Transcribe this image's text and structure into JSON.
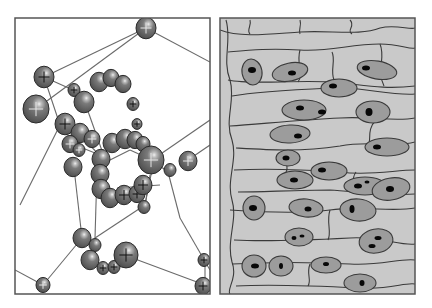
{
  "figure": {
    "width": 432,
    "height": 308,
    "background": "#ffffff",
    "colors": {
      "frame": "#555555",
      "network_line": "#6a6a6a",
      "sphere_fill": "#6e6e6e",
      "sphere_stroke": "#2a2a2a",
      "sphere_highlight": "#e8e8e8",
      "cell_fill": "#c9c9c9",
      "cell_stroke": "#3a3a3a",
      "nucleus_fill": "#9c9c9c",
      "nucleolus_fill": "#080808"
    }
  },
  "left_panel": {
    "name": "sphere-network-panel",
    "frame": {
      "x": 15,
      "y": 18,
      "w": 195,
      "h": 276
    },
    "lines": [
      [
        146,
        28,
        210,
        62
      ],
      [
        146,
        28,
        44,
        77
      ],
      [
        44,
        77,
        60,
        125
      ],
      [
        44,
        77,
        73,
        90
      ],
      [
        36,
        109,
        146,
        28
      ],
      [
        60,
        125,
        20,
        205
      ],
      [
        60,
        125,
        80,
        135
      ],
      [
        80,
        135,
        106,
        162
      ],
      [
        84,
        100,
        106,
        162
      ],
      [
        106,
        162,
        130,
        150
      ],
      [
        130,
        150,
        152,
        160
      ],
      [
        152,
        160,
        210,
        120
      ],
      [
        152,
        160,
        168,
        172
      ],
      [
        168,
        172,
        180,
        218
      ],
      [
        180,
        218,
        210,
        270
      ],
      [
        74,
        168,
        82,
        238
      ],
      [
        97,
        170,
        95,
        238
      ],
      [
        95,
        238,
        145,
        205
      ],
      [
        145,
        205,
        152,
        170
      ],
      [
        82,
        238,
        43,
        285
      ],
      [
        43,
        285,
        15,
        270
      ],
      [
        127,
        256,
        205,
        285
      ],
      [
        205,
        285,
        205,
        258
      ],
      [
        150,
        175,
        145,
        205
      ],
      [
        117,
        188,
        160,
        185
      ],
      [
        75,
        145,
        100,
        155
      ],
      [
        188,
        160,
        210,
        145
      ]
    ],
    "spheres": [
      {
        "cx": 146,
        "cy": 28,
        "r": 10,
        "cross": "white"
      },
      {
        "cx": 44,
        "cy": 77,
        "r": 10,
        "cross": "black"
      },
      {
        "cx": 36,
        "cy": 109,
        "r": 13,
        "cross": "white"
      },
      {
        "cx": 74,
        "cy": 90,
        "r": 6,
        "cross": "black"
      },
      {
        "cx": 99,
        "cy": 82,
        "r": 9,
        "cross": null
      },
      {
        "cx": 111,
        "cy": 78,
        "r": 8,
        "cross": null
      },
      {
        "cx": 123,
        "cy": 84,
        "r": 8,
        "cross": null
      },
      {
        "cx": 84,
        "cy": 102,
        "r": 10,
        "cross": null
      },
      {
        "cx": 133,
        "cy": 104,
        "r": 6,
        "cross": "black"
      },
      {
        "cx": 137,
        "cy": 124,
        "r": 5,
        "cross": "black"
      },
      {
        "cx": 65,
        "cy": 124,
        "r": 10,
        "cross": "black"
      },
      {
        "cx": 80,
        "cy": 133,
        "r": 9,
        "cross": null
      },
      {
        "cx": 70,
        "cy": 144,
        "r": 8,
        "cross": "white"
      },
      {
        "cx": 92,
        "cy": 139,
        "r": 8,
        "cross": "white"
      },
      {
        "cx": 79,
        "cy": 150,
        "r": 6,
        "cross": "white"
      },
      {
        "cx": 112,
        "cy": 143,
        "r": 9,
        "cross": null
      },
      {
        "cx": 125,
        "cy": 139,
        "r": 9,
        "cross": null
      },
      {
        "cx": 135,
        "cy": 140,
        "r": 8,
        "cross": null
      },
      {
        "cx": 143,
        "cy": 144,
        "r": 7,
        "cross": null
      },
      {
        "cx": 101,
        "cy": 159,
        "r": 9,
        "cross": null
      },
      {
        "cx": 151,
        "cy": 160,
        "r": 13,
        "cross": "white"
      },
      {
        "cx": 73,
        "cy": 167,
        "r": 9,
        "cross": null
      },
      {
        "cx": 100,
        "cy": 174,
        "r": 9,
        "cross": null
      },
      {
        "cx": 170,
        "cy": 170,
        "r": 6,
        "cross": null
      },
      {
        "cx": 188,
        "cy": 161,
        "r": 9,
        "cross": "white"
      },
      {
        "cx": 101,
        "cy": 189,
        "r": 9,
        "cross": null
      },
      {
        "cx": 110,
        "cy": 198,
        "r": 9,
        "cross": null
      },
      {
        "cx": 124,
        "cy": 195,
        "r": 9,
        "cross": "black"
      },
      {
        "cx": 137,
        "cy": 194,
        "r": 8,
        "cross": "black"
      },
      {
        "cx": 143,
        "cy": 185,
        "r": 9,
        "cross": "black"
      },
      {
        "cx": 144,
        "cy": 207,
        "r": 6,
        "cross": null
      },
      {
        "cx": 82,
        "cy": 238,
        "r": 9,
        "cross": null
      },
      {
        "cx": 95,
        "cy": 245,
        "r": 6,
        "cross": null
      },
      {
        "cx": 90,
        "cy": 260,
        "r": 9,
        "cross": null
      },
      {
        "cx": 103,
        "cy": 268,
        "r": 6,
        "cross": "black"
      },
      {
        "cx": 114,
        "cy": 267,
        "r": 6,
        "cross": "black"
      },
      {
        "cx": 126,
        "cy": 255,
        "r": 12,
        "cross": "black"
      },
      {
        "cx": 204,
        "cy": 260,
        "r": 6,
        "cross": "black"
      },
      {
        "cx": 203,
        "cy": 286,
        "r": 8,
        "cross": "black"
      },
      {
        "cx": 43,
        "cy": 285,
        "r": 7,
        "cross": "white"
      }
    ]
  },
  "right_panel": {
    "name": "cell-tissue-panel",
    "frame": {
      "x": 220,
      "y": 18,
      "w": 195,
      "h": 276
    },
    "boundaries": [
      "M220,30 C240,38 270,34 300,32 C330,30 360,36 380,28 C395,24 410,30 415,28",
      "M228,52 C250,50 270,48 300,50 C330,52 350,44 380,44 C400,44 410,50 415,48",
      "M228,80 C250,85 290,80 330,82 C360,84 380,90 415,86",
      "M232,96 C255,92 290,90 330,88 C360,86 390,96 415,94",
      "M230,126 C260,124 300,120 340,118 C370,116 395,122 415,118",
      "M236,148 C270,150 300,152 340,146 C370,140 395,148 415,142",
      "M234,170 C270,168 310,170 340,172 C370,176 395,170 415,170",
      "M238,192 C260,192 300,190 330,190 C360,192 390,196 415,194",
      "M230,210 C260,212 300,214 330,210 C360,206 395,212 415,208",
      "M234,240 C270,242 310,240 350,238 C380,236 400,246 415,244",
      "M232,264 C270,262 310,262 350,264 C380,266 400,258 415,260",
      "M236,286 C270,284 320,286 360,288 C390,290 405,282 415,284",
      "M226,20 C232,40 222,60 230,80 C236,100 224,120 232,140 C238,160 226,180 232,200 C238,220 226,240 232,262 C238,278 226,290 230,294",
      "M250,20 C252,26 246,30 250,34",
      "M300,20 C302,26 298,30 300,34",
      "M350,20 C356,26 346,30 352,34",
      "M332,52 C336,60 330,70 334,80",
      "M380,44 C386,58 376,70 384,86",
      "M376,120 C366,130 372,140 368,146",
      "M356,172 C350,180 356,186 352,192",
      "M330,210 C326,222 332,232 328,240",
      "M310,264 C306,274 312,280 308,286",
      "M300,50 C296,64 304,74 298,82",
      "M288,150 C282,160 290,166 286,172"
    ],
    "nuclei": [
      {
        "cx": 252,
        "cy": 72,
        "rx": 10,
        "ry": 13,
        "rot": -10,
        "spots": [
          {
            "cx": 252,
            "cy": 70,
            "rx": 4,
            "ry": 3
          }
        ]
      },
      {
        "cx": 290,
        "cy": 72,
        "rx": 18,
        "ry": 9,
        "rot": -12,
        "spots": [
          {
            "cx": 292,
            "cy": 73,
            "rx": 4,
            "ry": 2.5
          }
        ]
      },
      {
        "cx": 377,
        "cy": 70,
        "rx": 20,
        "ry": 9,
        "rot": 10,
        "spots": [
          {
            "cx": 366,
            "cy": 68,
            "rx": 4,
            "ry": 2.5
          }
        ]
      },
      {
        "cx": 339,
        "cy": 88,
        "rx": 18,
        "ry": 9,
        "rot": 0,
        "spots": [
          {
            "cx": 333,
            "cy": 86,
            "rx": 4,
            "ry": 2.5
          }
        ]
      },
      {
        "cx": 304,
        "cy": 110,
        "rx": 22,
        "ry": 10,
        "rot": 0,
        "spots": [
          {
            "cx": 300,
            "cy": 108,
            "rx": 4,
            "ry": 2.5
          },
          {
            "cx": 322,
            "cy": 112,
            "rx": 4,
            "ry": 2.5
          }
        ]
      },
      {
        "cx": 373,
        "cy": 112,
        "rx": 17,
        "ry": 11,
        "rot": 0,
        "spots": [
          {
            "cx": 369,
            "cy": 112,
            "rx": 3.5,
            "ry": 4
          }
        ]
      },
      {
        "cx": 290,
        "cy": 134,
        "rx": 20,
        "ry": 9,
        "rot": -3,
        "spots": [
          {
            "cx": 298,
            "cy": 136,
            "rx": 4,
            "ry": 2.5
          }
        ]
      },
      {
        "cx": 387,
        "cy": 147,
        "rx": 22,
        "ry": 9,
        "rot": 0,
        "spots": [
          {
            "cx": 377,
            "cy": 147,
            "rx": 4,
            "ry": 2.5
          }
        ]
      },
      {
        "cx": 329,
        "cy": 171,
        "rx": 18,
        "ry": 9,
        "rot": 0,
        "spots": [
          {
            "cx": 322,
            "cy": 170,
            "rx": 4,
            "ry": 2.5
          }
        ]
      },
      {
        "cx": 288,
        "cy": 158,
        "rx": 12,
        "ry": 8,
        "rot": 0,
        "spots": [
          {
            "cx": 286,
            "cy": 158,
            "rx": 3.5,
            "ry": 2.5
          }
        ]
      },
      {
        "cx": 365,
        "cy": 186,
        "rx": 21,
        "ry": 9,
        "rot": 0,
        "spots": [
          {
            "cx": 358,
            "cy": 186,
            "rx": 4,
            "ry": 2.5
          },
          {
            "cx": 367,
            "cy": 182,
            "rx": 2.5,
            "ry": 1.5
          }
        ]
      },
      {
        "cx": 295,
        "cy": 180,
        "rx": 18,
        "ry": 9,
        "rot": 0,
        "spots": [
          {
            "cx": 294,
            "cy": 180,
            "rx": 4,
            "ry": 2.5
          }
        ]
      },
      {
        "cx": 391,
        "cy": 189,
        "rx": 19,
        "ry": 11,
        "rot": -10,
        "spots": [
          {
            "cx": 390,
            "cy": 189,
            "rx": 4,
            "ry": 3
          }
        ]
      },
      {
        "cx": 254,
        "cy": 208,
        "rx": 11,
        "ry": 12,
        "rot": 0,
        "spots": [
          {
            "cx": 253,
            "cy": 208,
            "rx": 4,
            "ry": 3
          }
        ]
      },
      {
        "cx": 306,
        "cy": 208,
        "rx": 17,
        "ry": 9,
        "rot": 5,
        "spots": [
          {
            "cx": 308,
            "cy": 209,
            "rx": 3.5,
            "ry": 2.5
          }
        ]
      },
      {
        "cx": 358,
        "cy": 210,
        "rx": 18,
        "ry": 11,
        "rot": 5,
        "spots": [
          {
            "cx": 352,
            "cy": 209,
            "rx": 2.5,
            "ry": 4
          }
        ]
      },
      {
        "cx": 299,
        "cy": 237,
        "rx": 14,
        "ry": 9,
        "rot": 0,
        "spots": [
          {
            "cx": 294,
            "cy": 238,
            "rx": 2.5,
            "ry": 2
          },
          {
            "cx": 302,
            "cy": 236,
            "rx": 2.5,
            "ry": 1.5
          }
        ]
      },
      {
        "cx": 376,
        "cy": 241,
        "rx": 17,
        "ry": 12,
        "rot": -10,
        "spots": [
          {
            "cx": 372,
            "cy": 246,
            "rx": 3.5,
            "ry": 2
          },
          {
            "cx": 378,
            "cy": 238,
            "rx": 3.5,
            "ry": 2
          }
        ]
      },
      {
        "cx": 254,
        "cy": 266,
        "rx": 12,
        "ry": 11,
        "rot": 0,
        "spots": [
          {
            "cx": 255,
            "cy": 266,
            "rx": 4,
            "ry": 2.5
          }
        ]
      },
      {
        "cx": 281,
        "cy": 266,
        "rx": 12,
        "ry": 10,
        "rot": 0,
        "spots": [
          {
            "cx": 281,
            "cy": 266,
            "rx": 2,
            "ry": 3
          }
        ]
      },
      {
        "cx": 326,
        "cy": 265,
        "rx": 15,
        "ry": 8,
        "rot": 0,
        "spots": [
          {
            "cx": 326,
            "cy": 264,
            "rx": 3,
            "ry": 2
          }
        ]
      },
      {
        "cx": 360,
        "cy": 283,
        "rx": 16,
        "ry": 9,
        "rot": 0,
        "spots": [
          {
            "cx": 362,
            "cy": 283,
            "rx": 2.5,
            "ry": 3
          }
        ]
      }
    ]
  }
}
